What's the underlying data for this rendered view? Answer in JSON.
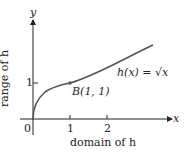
{
  "figure": {
    "y_axis_label": "y",
    "x_axis_label": "x",
    "range_label": "range of h",
    "domain_label": "domain of h",
    "function_label": "h(x) = √x",
    "point_label": "B(1, 1)",
    "origin_label": "0",
    "x_ticks": [
      "1",
      "2"
    ],
    "y_ticks": [
      "1"
    ],
    "colors": {
      "curve": "#555555",
      "axis": "#222222"
    }
  }
}
